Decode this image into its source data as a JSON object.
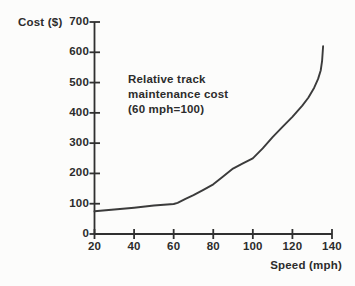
{
  "figure": {
    "background": "#fcfcfb",
    "text_color": "#2c2c2c",
    "axis_color": "#303030",
    "curve_color": "#3b3b3b"
  },
  "chart_data": {
    "type": "line",
    "title": "",
    "annotation": [
      "Relative track",
      "maintenance cost",
      "(60 mph=100)"
    ],
    "x_axis": {
      "label": "Speed (mph)",
      "ticks": [
        20,
        40,
        60,
        80,
        100,
        120,
        140
      ],
      "range": [
        20,
        140
      ],
      "grid": false
    },
    "y_axis": {
      "label": "Cost ($)",
      "ticks": [
        0,
        100,
        200,
        300,
        400,
        500,
        600,
        700
      ],
      "range": [
        0,
        700
      ],
      "grid": false
    },
    "legend": null,
    "series": [
      {
        "name": "relative-track-maintenance-cost",
        "points": [
          [
            20,
            75
          ],
          [
            30,
            81
          ],
          [
            40,
            87
          ],
          [
            50,
            94
          ],
          [
            60,
            99
          ],
          [
            62,
            103
          ],
          [
            66,
            116
          ],
          [
            70,
            128
          ],
          [
            75,
            146
          ],
          [
            80,
            164
          ],
          [
            85,
            190
          ],
          [
            90,
            216
          ],
          [
            95,
            233
          ],
          [
            100,
            250
          ],
          [
            105,
            283
          ],
          [
            110,
            320
          ],
          [
            115,
            354
          ],
          [
            120,
            387
          ],
          [
            125,
            424
          ],
          [
            128,
            450
          ],
          [
            131,
            483
          ],
          [
            133,
            512
          ],
          [
            134.3,
            540
          ],
          [
            135,
            572
          ],
          [
            135.5,
            620
          ]
        ]
      }
    ]
  }
}
